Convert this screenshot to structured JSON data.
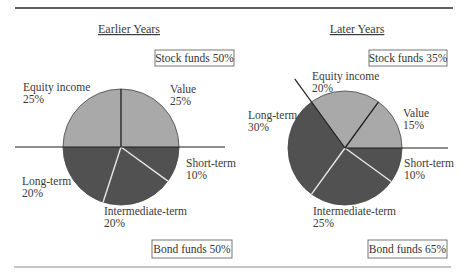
{
  "chart_data": [
    {
      "type": "pie",
      "title": "Earlier Years",
      "start_angle_deg": 0,
      "direction": "counterclockwise",
      "slices": [
        {
          "label": "Value",
          "value": 25,
          "pct_text": "25%",
          "group": "stock"
        },
        {
          "label": "Equity income",
          "value": 25,
          "pct_text": "25%",
          "group": "stock"
        },
        {
          "label": "Long-term",
          "value": 20,
          "pct_text": "20%",
          "group": "bond"
        },
        {
          "label": "Intermediate-term",
          "value": 20,
          "pct_text": "20%",
          "group": "bond"
        },
        {
          "label": "Short-term",
          "value": 10,
          "pct_text": "10%",
          "group": "bond"
        }
      ],
      "group_totals": {
        "stock": {
          "label": "Stock funds 50%",
          "value": 50
        },
        "bond": {
          "label": "Bond funds 50%",
          "value": 50
        }
      }
    },
    {
      "type": "pie",
      "title": "Later Years",
      "start_angle_deg": 0,
      "direction": "counterclockwise",
      "slices": [
        {
          "label": "Value",
          "value": 15,
          "pct_text": "15%",
          "group": "stock"
        },
        {
          "label": "Equity income",
          "value": 20,
          "pct_text": "20%",
          "group": "stock"
        },
        {
          "label": "Long-term",
          "value": 30,
          "pct_text": "30%",
          "group": "bond"
        },
        {
          "label": "Intermediate-term",
          "value": 25,
          "pct_text": "25%",
          "group": "bond"
        },
        {
          "label": "Short-term",
          "value": 10,
          "pct_text": "10%",
          "group": "bond"
        }
      ],
      "group_totals": {
        "stock": {
          "label": "Stock funds 35%",
          "value": 35
        },
        "bond": {
          "label": "Bond funds 65%",
          "value": 65
        }
      }
    }
  ],
  "colors": {
    "stock": "#a9a9a9",
    "bond": "#515151",
    "stock_divider": "#1e1e1e",
    "bond_divider": "#e6e6e6",
    "rule": "#2a2a2a"
  }
}
